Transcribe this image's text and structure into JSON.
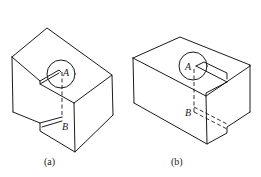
{
  "figures": [
    {
      "id": "a",
      "caption": "(a)",
      "point_labels": {
        "top": "A",
        "bottom": "B"
      }
    },
    {
      "id": "b",
      "caption": "(b)",
      "point_labels": {
        "top": "A",
        "bottom": "B"
      }
    }
  ],
  "colors": {
    "line": "#1a1a1a",
    "background": "#ffffff"
  }
}
